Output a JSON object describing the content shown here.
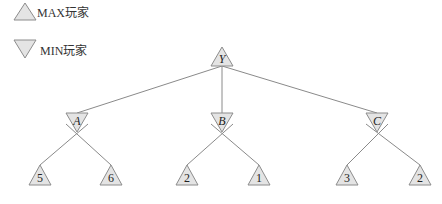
{
  "legend": {
    "max_label": "MAX玩家",
    "min_label": "MIN玩家"
  },
  "tree": {
    "root": {
      "label": "Y",
      "type": "MAX"
    },
    "level1": [
      {
        "label": "A",
        "type": "MIN"
      },
      {
        "label": "B",
        "type": "MIN"
      },
      {
        "label": "C",
        "type": "MIN"
      }
    ],
    "leaves": [
      {
        "label": "5",
        "parent": "A",
        "type": "MAX"
      },
      {
        "label": "6",
        "parent": "A",
        "type": "MAX"
      },
      {
        "label": "2",
        "parent": "B",
        "type": "MAX"
      },
      {
        "label": "1",
        "parent": "B",
        "type": "MAX"
      },
      {
        "label": "3",
        "parent": "C",
        "type": "MAX"
      },
      {
        "label": "2",
        "parent": "C",
        "type": "MAX"
      }
    ]
  },
  "colors": {
    "node_fill": "#e4e4e4",
    "node_stroke": "#8c8c8c",
    "edge": "#8a8a8a"
  }
}
